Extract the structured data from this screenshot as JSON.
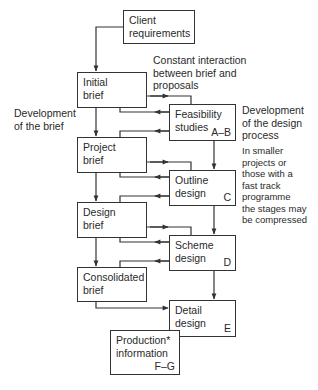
{
  "diagram": {
    "boxes": {
      "client": {
        "title": "Client\nrequirements",
        "code": ""
      },
      "initial_brief": {
        "title": "Initial\nbrief",
        "code": ""
      },
      "feasibility": {
        "title": "Feasibility\nstudies",
        "code": "A–B"
      },
      "project_brief": {
        "title": "Project\nbrief",
        "code": ""
      },
      "outline": {
        "title": "Outline\ndesign",
        "code": "C"
      },
      "design_brief": {
        "title": "Design\nbrief",
        "code": ""
      },
      "scheme": {
        "title": "Scheme\ndesign",
        "code": "D"
      },
      "consolidated": {
        "title": "Consolidated\nbrief",
        "code": ""
      },
      "detail": {
        "title": "Detail\ndesign",
        "code": "E"
      },
      "production": {
        "title": "Production*\ninformation",
        "code": "F–G"
      }
    },
    "labels": {
      "interaction": "Constant interaction\nbetween brief and\nproposals",
      "brief_dev": "Development\nof the brief",
      "design_dev": "Development\nof the design\nprocess",
      "note": "In smaller\nprojects or\nthose with a\nfast track\nprogramme\nthe stages may\nbe compressed"
    },
    "colors": {
      "line": "#333333",
      "text": "#2a2a2a",
      "background": "#ffffff"
    }
  }
}
